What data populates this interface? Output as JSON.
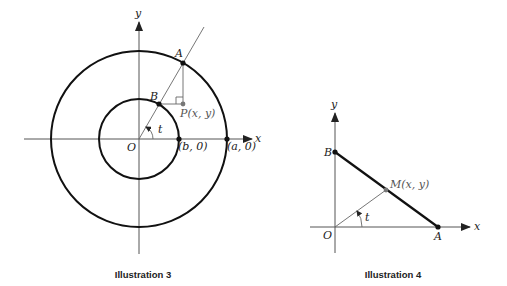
{
  "illustration3": {
    "caption": "Illustration 3",
    "x_axis_label": "x",
    "y_axis_label": "y",
    "origin_label": "O",
    "point_A_label": "A",
    "point_B_label": "B",
    "point_P_label": "P(x, y)",
    "point_b0_label": "(b, 0)",
    "point_a0_label": "(a, 0)",
    "angle_label": "t",
    "angle_degrees": 60,
    "outer_circle_radius_name": "a",
    "inner_circle_radius_name": "b"
  },
  "illustration4": {
    "caption": "Illustration 4",
    "x_axis_label": "x",
    "y_axis_label": "y",
    "origin_label": "O",
    "point_A_label": "A",
    "point_B_label": "B",
    "point_M_label": "M(x, y)",
    "angle_label": "t"
  }
}
